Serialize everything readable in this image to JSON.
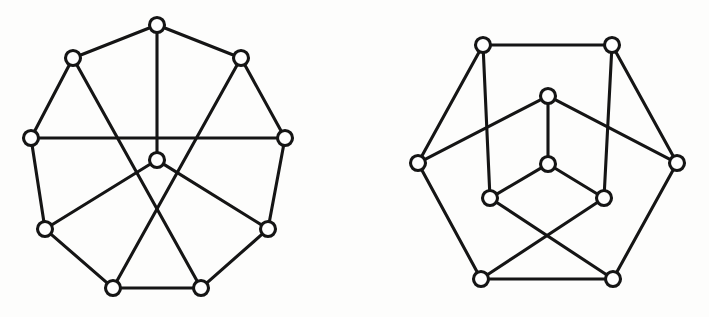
{
  "figure": {
    "background_color": "#fdfdfc",
    "ink_color": "#151515",
    "vertex_fill": "#ffffff",
    "vertex_radius": 7.5,
    "edge_width": 3.1,
    "bleed_through_text": {
      "line_1": "siqms oi svitsmsila ns zswllA",
      "line_2": ".dqsig tlst 101 ",
      "line_3": "o im zoms"
    },
    "graphs": [
      {
        "name": "left-graph",
        "label": "nine-outer-plus-center-graph",
        "vertex_count": 10,
        "edge_count": 15,
        "vertices": [
          {
            "id": "L0",
            "name": "top",
            "x": 157,
            "y": 25
          },
          {
            "id": "L1",
            "name": "upper-right",
            "x": 241,
            "y": 58
          },
          {
            "id": "L2",
            "name": "right",
            "x": 285,
            "y": 138
          },
          {
            "id": "L3",
            "name": "lower-right",
            "x": 268,
            "y": 229
          },
          {
            "id": "L4",
            "name": "bottom-right",
            "x": 201,
            "y": 288
          },
          {
            "id": "L5",
            "name": "bottom-left",
            "x": 113,
            "y": 288
          },
          {
            "id": "L6",
            "name": "lower-left",
            "x": 45,
            "y": 229
          },
          {
            "id": "L7",
            "name": "left",
            "x": 31,
            "y": 138
          },
          {
            "id": "L8",
            "name": "upper-left",
            "x": 73,
            "y": 58
          },
          {
            "id": "L9",
            "name": "center",
            "x": 157,
            "y": 160
          }
        ],
        "edges": [
          {
            "from": "L0",
            "to": "L1"
          },
          {
            "from": "L1",
            "to": "L2"
          },
          {
            "from": "L2",
            "to": "L3"
          },
          {
            "from": "L3",
            "to": "L4"
          },
          {
            "from": "L4",
            "to": "L5"
          },
          {
            "from": "L5",
            "to": "L6"
          },
          {
            "from": "L6",
            "to": "L7"
          },
          {
            "from": "L7",
            "to": "L8"
          },
          {
            "from": "L8",
            "to": "L0"
          },
          {
            "from": "L0",
            "to": "L9"
          },
          {
            "from": "L7",
            "to": "L2"
          },
          {
            "from": "L8",
            "to": "L4"
          },
          {
            "from": "L1",
            "to": "L5"
          },
          {
            "from": "L6",
            "to": "L9"
          },
          {
            "from": "L3",
            "to": "L9"
          }
        ]
      },
      {
        "name": "right-graph",
        "label": "six-outer-plus-six-inner-graph",
        "vertex_count": 11,
        "edge_count": 16,
        "vertices": [
          {
            "id": "R0",
            "name": "outer-top-left",
            "x": 483,
            "y": 45
          },
          {
            "id": "R1",
            "name": "outer-top-right",
            "x": 612,
            "y": 45
          },
          {
            "id": "R2",
            "name": "outer-right",
            "x": 677,
            "y": 163
          },
          {
            "id": "R3",
            "name": "outer-bottom-right",
            "x": 613,
            "y": 279
          },
          {
            "id": "R4",
            "name": "outer-bottom-left",
            "x": 481,
            "y": 279
          },
          {
            "id": "R5",
            "name": "outer-left",
            "x": 418,
            "y": 163
          },
          {
            "id": "R6",
            "name": "inner-top",
            "x": 548,
            "y": 96
          },
          {
            "id": "R7",
            "name": "inner-center",
            "x": 548,
            "y": 164
          },
          {
            "id": "R8",
            "name": "inner-lower-left",
            "x": 490,
            "y": 198
          },
          {
            "id": "R9",
            "name": "inner-lower-right",
            "x": 604,
            "y": 198
          }
        ],
        "edges": [
          {
            "from": "R0",
            "to": "R1"
          },
          {
            "from": "R1",
            "to": "R2"
          },
          {
            "from": "R2",
            "to": "R3"
          },
          {
            "from": "R3",
            "to": "R4"
          },
          {
            "from": "R4",
            "to": "R5"
          },
          {
            "from": "R5",
            "to": "R0"
          },
          {
            "from": "R0",
            "to": "R8"
          },
          {
            "from": "R1",
            "to": "R9"
          },
          {
            "from": "R5",
            "to": "R6"
          },
          {
            "from": "R2",
            "to": "R6"
          },
          {
            "from": "R4",
            "to": "R9"
          },
          {
            "from": "R3",
            "to": "R8"
          },
          {
            "from": "R6",
            "to": "R7"
          },
          {
            "from": "R7",
            "to": "R8"
          },
          {
            "from": "R7",
            "to": "R9"
          }
        ]
      }
    ]
  }
}
